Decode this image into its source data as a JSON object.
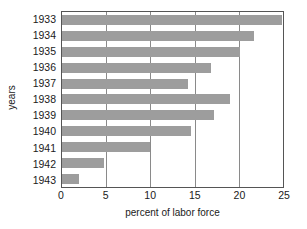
{
  "chart_data": {
    "type": "bar",
    "orientation": "horizontal",
    "title": "",
    "xlabel": "percent of labor force",
    "ylabel": "years",
    "categories": [
      "1933",
      "1934",
      "1935",
      "1936",
      "1937",
      "1938",
      "1939",
      "1940",
      "1941",
      "1942",
      "1943"
    ],
    "values": [
      24.9,
      21.7,
      20.1,
      16.9,
      14.3,
      19.0,
      17.2,
      14.6,
      9.9,
      4.7,
      1.9
    ],
    "xlim": [
      0,
      25
    ],
    "ylim": null,
    "xticks": [
      "0",
      "5",
      "10",
      "15",
      "20",
      "25"
    ],
    "xtick_values": [
      0,
      5,
      10,
      15,
      20,
      25
    ],
    "grid": "vertical",
    "legend": null,
    "bar_color": "#9d9d9d",
    "axis_color": "#555555",
    "grid_color": "#8a8a8a"
  }
}
